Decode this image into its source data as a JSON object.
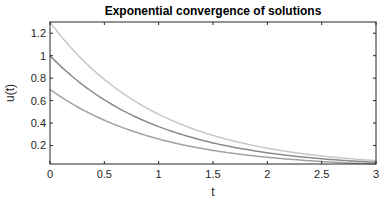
{
  "chart_data": {
    "type": "line",
    "title": "Exponential convergence of solutions",
    "xlabel": "t",
    "ylabel": "u(t)",
    "xlim": [
      0,
      3
    ],
    "ylim": [
      0.035,
      1.3
    ],
    "xticks": [
      0,
      0.5,
      1,
      1.5,
      2,
      2.5,
      3
    ],
    "xtick_labels": [
      "0",
      "0.5",
      "1",
      "1.5",
      "2",
      "2.5",
      "3"
    ],
    "yticks": [
      0.2,
      0.4,
      0.6,
      0.8,
      1,
      1.2
    ],
    "ytick_labels": [
      "0.2",
      "0.4",
      "0.6",
      "0.8",
      "1",
      "1.2"
    ],
    "grid": false,
    "legend": null,
    "x": [
      0,
      0.25,
      0.5,
      0.75,
      1,
      1.25,
      1.5,
      1.75,
      2,
      2.25,
      2.5,
      2.75,
      3
    ],
    "series": [
      {
        "name": "u0 = 1.3",
        "color": "#c8c8c8",
        "values": [
          1.3,
          1.012,
          0.789,
          0.614,
          0.478,
          0.372,
          0.29,
          0.226,
          0.176,
          0.137,
          0.107,
          0.083,
          0.065
        ]
      },
      {
        "name": "u0 = 1.0",
        "color": "#8a8a8a",
        "values": [
          1.0,
          0.779,
          0.607,
          0.472,
          0.368,
          0.287,
          0.223,
          0.174,
          0.135,
          0.105,
          0.082,
          0.064,
          0.05
        ]
      },
      {
        "name": "u0 = 0.7",
        "color": "#a2a2a2",
        "values": [
          0.7,
          0.545,
          0.425,
          0.331,
          0.258,
          0.2,
          0.156,
          0.122,
          0.095,
          0.074,
          0.057,
          0.045,
          0.035
        ]
      }
    ]
  }
}
